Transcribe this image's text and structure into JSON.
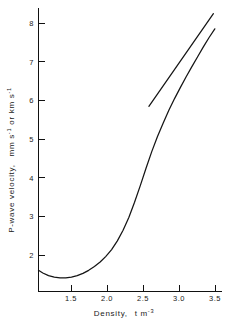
{
  "chart_data": {
    "type": "line",
    "title": "",
    "xlabel": "Density, t m⁻³",
    "xlabel_parts": {
      "name": "Density,",
      "unit_base": "t m",
      "unit_exp": "-3"
    },
    "ylabel": "P-wave velocity,  mm s⁻¹ or km s⁻¹",
    "ylabel_parts": {
      "name": "P-wave velocity,",
      "unit_a_base": "mm s",
      "unit_a_exp": "-1",
      "conjunction": "or",
      "unit_b_base": "km s",
      "unit_b_exp": "-1"
    },
    "xlim": [
      1.04,
      3.6
    ],
    "ylim": [
      1.1,
      8.6
    ],
    "xticks": [
      1.5,
      2.0,
      2.5,
      3.0,
      3.5
    ],
    "xtick_labels": [
      "1.5",
      "2.0",
      "2.5",
      "3.0",
      "3.5"
    ],
    "yticks": [
      2,
      3,
      4,
      5,
      6,
      7,
      8
    ],
    "ytick_labels": [
      "2",
      "3",
      "4",
      "5",
      "6",
      "7",
      "8"
    ],
    "grid": false,
    "legend": null,
    "series": [
      {
        "name": "P-wave velocity curve",
        "x": [
          1.04,
          1.1,
          1.18,
          1.26,
          1.34,
          1.42,
          1.5,
          1.58,
          1.66,
          1.74,
          1.82,
          1.9,
          1.98,
          2.06,
          2.14,
          2.22,
          2.3,
          2.38,
          2.46,
          2.54,
          2.62,
          2.7,
          2.78,
          2.86,
          2.94,
          3.02,
          3.1,
          3.18,
          3.26,
          3.34,
          3.42,
          3.5
        ],
        "y": [
          1.66,
          1.59,
          1.52,
          1.48,
          1.46,
          1.46,
          1.48,
          1.52,
          1.58,
          1.66,
          1.76,
          1.88,
          2.03,
          2.21,
          2.44,
          2.72,
          3.06,
          3.46,
          3.9,
          4.36,
          4.8,
          5.2,
          5.56,
          5.9,
          6.21,
          6.5,
          6.78,
          7.05,
          7.31,
          7.57,
          7.82,
          8.05
        ]
      },
      {
        "name": "Reference straight line",
        "x": [
          2.58,
          3.48
        ],
        "y": [
          6.0,
          8.45
        ]
      }
    ]
  },
  "figure": {
    "background_color": "#ffffff",
    "line_color": "#151515",
    "axis_color": "#111111"
  }
}
